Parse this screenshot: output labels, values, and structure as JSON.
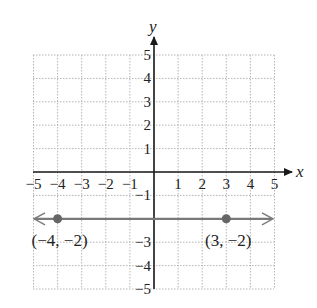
{
  "chart_data": {
    "type": "line",
    "title": "",
    "xlabel": "x",
    "ylabel": "y",
    "xlim": [
      -5,
      5
    ],
    "ylim": [
      -5,
      5
    ],
    "grid": true,
    "x_ticks": [
      "−5",
      "−4",
      "−3",
      "−2",
      "−1",
      "1",
      "2",
      "3",
      "4",
      "5"
    ],
    "y_ticks": [
      "5",
      "4",
      "3",
      "2",
      "1",
      "−1",
      "−3",
      "−4",
      "−5"
    ],
    "series": [
      {
        "name": "horizontal line y = -2",
        "kind": "line with arrows both ends",
        "equation": "y = -2",
        "points": [
          {
            "x": -4,
            "y": -2,
            "label": "(−4, −2)"
          },
          {
            "x": 3,
            "y": -2,
            "label": "(3, −2)"
          }
        ]
      }
    ],
    "colors": {
      "line": "#7a7a7a",
      "point": "#666666",
      "axis": "#1a1a1a",
      "grid": "#b5b5b5"
    }
  },
  "labels": {
    "x_axis": "x",
    "y_axis": "y",
    "point_a": "(−4, −2)",
    "point_b": "(3, −2)"
  }
}
